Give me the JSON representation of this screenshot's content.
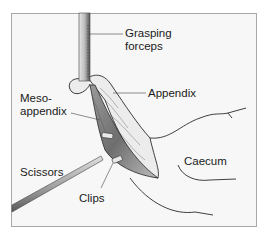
{
  "diagram": {
    "labels": {
      "grasping_forceps_line1": "Grasping",
      "grasping_forceps_line2": "forceps",
      "appendix": "Appendix",
      "mesoappendix_line1": "Meso-",
      "mesoappendix_line2": "appendix",
      "caecum": "Caecum",
      "scissors": "Scissors",
      "clips": "Clips"
    },
    "colors": {
      "background": "#f7f7f7",
      "border": "#a8a8a8",
      "mesoappendix_fill": "#7a7a7a",
      "appendix_fill": "#e8e8e8",
      "outline": "#2a2a2a"
    }
  }
}
